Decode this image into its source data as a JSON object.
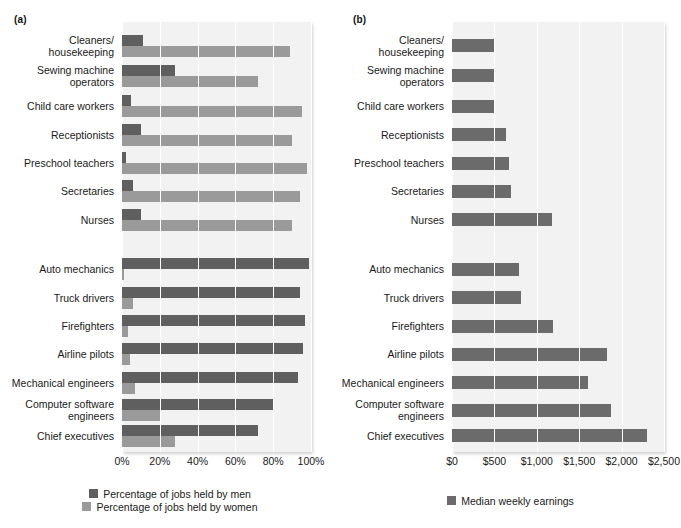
{
  "panel_a": {
    "label": "(a)",
    "legend": [
      {
        "key": "men",
        "text": "Percentage of jobs held by men",
        "color": "#5f5f5f"
      },
      {
        "key": "women",
        "text": "Percentage of jobs held by women",
        "color": "#9a9a9a"
      }
    ]
  },
  "panel_b": {
    "label": "(b)",
    "legend": [
      {
        "key": "earn",
        "text": "Median weekly earnings",
        "color": "#6b6b6b"
      }
    ]
  },
  "chart_data": [
    {
      "type": "bar",
      "panel": "(a)",
      "orientation": "horizontal",
      "title": "",
      "xlabel": "",
      "ylabel": "",
      "xlim": [
        0,
        100
      ],
      "xticks": [
        0,
        20,
        40,
        60,
        80,
        100
      ],
      "xticklabels": [
        "0%",
        "20%",
        "40%",
        "60%",
        "80%",
        "100%"
      ],
      "grid": true,
      "legend_position": "bottom",
      "categories": [
        "Cleaners/\nhousekeeping",
        "Sewing machine\noperators",
        "Child care workers",
        "Receptionists",
        "Preschool teachers",
        "Secretaries",
        "Nurses",
        "Auto mechanics",
        "Truck drivers",
        "Firefighters",
        "Airline pilots",
        "Mechanical engineers",
        "Computer software\nengineers",
        "Chief executives"
      ],
      "series": [
        {
          "name": "Percentage of jobs held by men",
          "color": "#5f5f5f",
          "values": [
            11,
            28,
            5,
            10,
            2,
            6,
            10,
            99,
            94,
            97,
            96,
            93,
            80,
            72
          ]
        },
        {
          "name": "Percentage of jobs held by women",
          "color": "#9a9a9a",
          "values": [
            89,
            72,
            95,
            90,
            98,
            94,
            90,
            1,
            6,
            3,
            4,
            7,
            20,
            28
          ]
        }
      ]
    },
    {
      "type": "bar",
      "panel": "(b)",
      "orientation": "horizontal",
      "title": "",
      "xlabel": "",
      "ylabel": "",
      "xlim": [
        0,
        2500
      ],
      "xticks": [
        0,
        500,
        1000,
        1500,
        2000,
        2500
      ],
      "xticklabels": [
        "$0",
        "$500",
        "$1,000",
        "$1,500",
        "$2,000",
        "$2,500"
      ],
      "grid": true,
      "legend_position": "bottom",
      "categories": [
        "Cleaners/\nhousekeeping",
        "Sewing machine\noperators",
        "Child care workers",
        "Receptionists",
        "Preschool teachers",
        "Secretaries",
        "Nurses",
        "Auto mechanics",
        "Truck drivers",
        "Firefighters",
        "Airline pilots",
        "Mechanical engineers",
        "Computer software\nengineers",
        "Chief executives"
      ],
      "series": [
        {
          "name": "Median weekly earnings",
          "color": "#6b6b6b",
          "values": [
            490,
            500,
            490,
            640,
            670,
            700,
            1180,
            790,
            810,
            1190,
            1830,
            1600,
            1870,
            2300
          ]
        }
      ]
    }
  ]
}
